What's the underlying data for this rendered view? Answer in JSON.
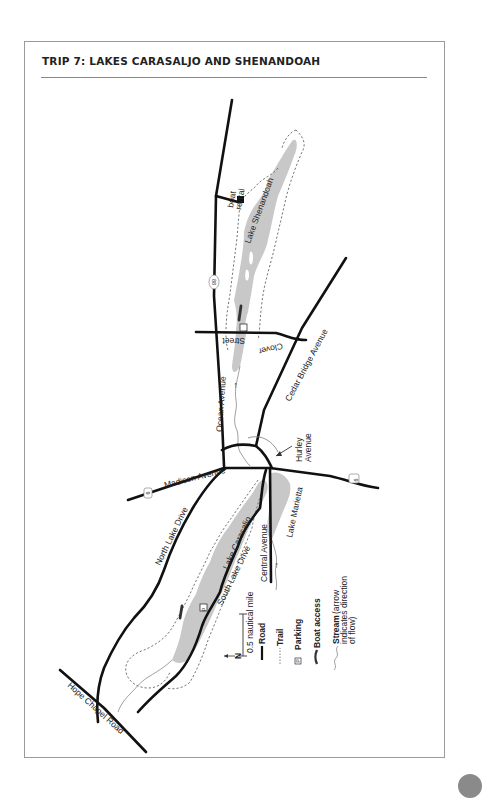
{
  "page": {
    "title": "TRIP 7: LAKES CARASALJO AND SHENANDOAH"
  },
  "map": {
    "lakes": [
      "Lake Shenandoah",
      "Lake Carasaljo",
      "Lake Marietta"
    ],
    "roads": {
      "ocean_avenue": "Ocean Avenue",
      "clover": "Clover",
      "street": "Street",
      "cedar_bridge_avenue": "Cedar Bridge Avenue",
      "hurley": "Hurley",
      "avenue": "Avenue",
      "madison_avenue": "Madison Avenue",
      "north_lake_drive": "North Lake Drive",
      "south_lake_drive": "South Lake Drive",
      "central_avenue": "Central Avenue",
      "hope_chapel_road": "Hope Chapel Road"
    },
    "route_shields": {
      "route_88": "88",
      "route_9_west": "9",
      "route_9_east": "9"
    },
    "boat_rental": [
      "boat",
      "rental"
    ],
    "parking_symbol": "P",
    "north_label": "N"
  },
  "legend": {
    "scale": "0.5 nautical mile",
    "items": [
      {
        "symbol": "road",
        "label": "Road"
      },
      {
        "symbol": "trail",
        "label": "Trail"
      },
      {
        "symbol": "parking",
        "label": "Parking",
        "glyph": "P"
      },
      {
        "symbol": "boat-access",
        "label": "Boat access"
      },
      {
        "symbol": "stream",
        "label": "Stream",
        "note_lines": [
          "(arrow",
          "indicates direction",
          "of flow)"
        ]
      }
    ]
  },
  "colors": {
    "lake": "#c8c8c8",
    "road": "#111111",
    "frame": "#9a9a9a",
    "tab": "#8a8a8a"
  }
}
